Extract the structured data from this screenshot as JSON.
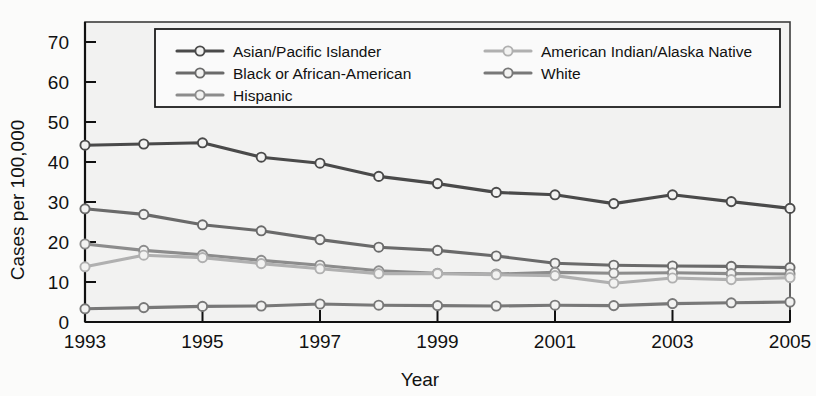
{
  "chart_data": {
    "type": "line",
    "title": "",
    "xlabel": "Year",
    "ylabel": "Cases per 100,000",
    "x": [
      1993,
      1994,
      1995,
      1996,
      1997,
      1998,
      1999,
      2000,
      2001,
      2002,
      2003,
      2004,
      2005
    ],
    "xtick_labels": [
      "1993",
      "1995",
      "1997",
      "1999",
      "2001",
      "2003",
      "2005"
    ],
    "xtick_values": [
      1993,
      1995,
      1997,
      1999,
      2001,
      2003,
      2005
    ],
    "ytick_labels": [
      "0",
      "10",
      "20",
      "30",
      "40",
      "50",
      "60",
      "70"
    ],
    "ytick_values": [
      0,
      10,
      20,
      30,
      40,
      50,
      60,
      70
    ],
    "xlim": [
      1993,
      2005
    ],
    "ylim": [
      0,
      75
    ],
    "grid": false,
    "legend_position": "top-inside",
    "series": [
      {
        "name": "Asian/Pacific Islander",
        "color": "#4a4a4a",
        "values": [
          44.2,
          44.5,
          44.8,
          41.2,
          39.7,
          36.4,
          34.6,
          32.4,
          31.8,
          29.6,
          31.8,
          30.1,
          28.4
        ]
      },
      {
        "name": "Black or African-American",
        "color": "#6a6a6a",
        "values": [
          28.3,
          26.9,
          24.3,
          22.8,
          20.6,
          18.7,
          17.9,
          16.5,
          14.7,
          14.2,
          14.0,
          13.9,
          13.6
        ]
      },
      {
        "name": "Hispanic",
        "color": "#8c8c8c",
        "values": [
          19.5,
          17.9,
          16.8,
          15.4,
          14.2,
          12.8,
          12.2,
          12.0,
          12.4,
          12.2,
          12.3,
          12.1,
          12.0
        ]
      },
      {
        "name": "American Indian/Alaska Native",
        "color": "#b0b0b0",
        "values": [
          13.8,
          16.7,
          16.1,
          14.6,
          13.3,
          12.1,
          12.1,
          11.8,
          11.6,
          9.7,
          11.0,
          10.6,
          11.1
        ]
      },
      {
        "name": "White",
        "color": "#787878",
        "values": [
          3.3,
          3.6,
          3.9,
          4.0,
          4.5,
          4.2,
          4.1,
          4.0,
          4.2,
          4.1,
          4.6,
          4.8,
          5.0
        ]
      }
    ]
  },
  "legend": {
    "entries": [
      {
        "label": "Asian/Pacific Islander"
      },
      {
        "label": "Black or African-American"
      },
      {
        "label": "Hispanic"
      },
      {
        "label": "American Indian/Alaska Native"
      },
      {
        "label": "White"
      }
    ]
  },
  "bleed_text": [
    "ts which they develop a case of disease",
    "age groups previously",
    "is testing rate cases of",
    "control HIV and transmit into non a",
    "their most important of needed",
    "The majority of cases in the",
    "been increasing in the"
  ]
}
